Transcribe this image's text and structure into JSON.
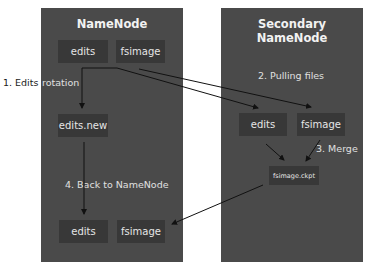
{
  "namenode": {
    "title": "NameNode",
    "boxes": {
      "edits": "edits",
      "fsimage": "fsimage",
      "edits_new": "edits.new",
      "edits_bottom": "edits",
      "fsimage_bottom": "fsimage"
    }
  },
  "secondary": {
    "title": "Secondary NameNode",
    "boxes": {
      "edits": "edits",
      "fsimage": "fsimage",
      "checkpoint": "fsimage.ckpt"
    }
  },
  "steps": {
    "step1_prefix": "1. Edits",
    "step1_suffix": "rotation",
    "step2": "2. Pulling files",
    "step3": "3. Merge",
    "step4": "4. Back to NameNode"
  },
  "colors": {
    "panel": "#4a4a4a",
    "box": "#383838",
    "text": "#e6e6e6",
    "arrow": "#111111"
  }
}
